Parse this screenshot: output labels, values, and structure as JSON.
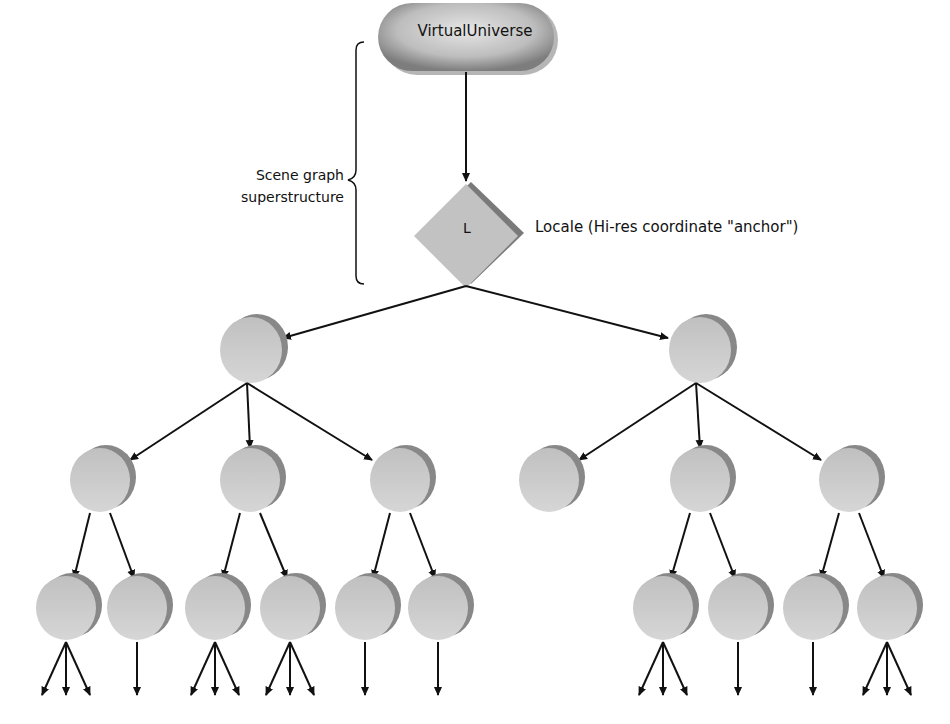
{
  "diagram": {
    "type": "scene-graph-tree",
    "root": {
      "label": "VirtualUniverse",
      "shape": "rounded-pill"
    },
    "locale": {
      "letter": "L",
      "description": "Locale (Hi-res coordinate \"anchor\")",
      "shape": "diamond"
    },
    "bracket": {
      "label": "Scene graph superstructure",
      "line1": "Scene graph",
      "line2": "superstructure"
    },
    "levels": [
      {
        "level": 1,
        "node_count": 2
      },
      {
        "level": 2,
        "node_count": 6
      },
      {
        "level": 3,
        "node_count": 10
      }
    ],
    "tree": {
      "children": [
        {
          "children": [
            {
              "children": [
                {
                  "leaf_arrows": 3
                },
                {
                  "leaf_arrows": 1
                }
              ]
            },
            {
              "children": [
                {
                  "leaf_arrows": 3
                },
                {
                  "leaf_arrows": 3
                }
              ]
            },
            {
              "children": [
                {
                  "leaf_arrows": 1
                },
                {
                  "leaf_arrows": 1
                }
              ]
            }
          ]
        },
        {
          "children": [
            {
              "children": []
            },
            {
              "children": [
                {
                  "leaf_arrows": 3
                },
                {
                  "leaf_arrows": 1
                }
              ]
            },
            {
              "children": [
                {
                  "leaf_arrows": 1
                },
                {
                  "leaf_arrows": 3
                }
              ]
            }
          ]
        }
      ]
    },
    "colors": {
      "node_fill": "#c4c4c4",
      "node_shadow": "#8a8a8a",
      "arrow": "#111111",
      "background": "#ffffff"
    }
  }
}
